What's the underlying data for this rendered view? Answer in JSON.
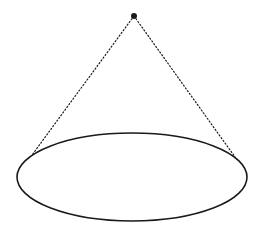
{
  "diagram": {
    "type": "cone-outline",
    "colors": {
      "stroke": "#1a1a1a",
      "background": "#ffffff"
    },
    "apex": {
      "x": 134,
      "y": 16,
      "r": 3
    },
    "base_ellipse": {
      "cx": 132,
      "cy": 177,
      "rx": 115,
      "ry": 44,
      "stroke_width": 1.6
    },
    "edges": [
      {
        "x1": 134,
        "y1": 16,
        "x2": 32,
        "y2": 155,
        "style": "dotted"
      },
      {
        "x1": 134,
        "y1": 16,
        "x2": 235,
        "y2": 157,
        "style": "dotted"
      }
    ]
  }
}
